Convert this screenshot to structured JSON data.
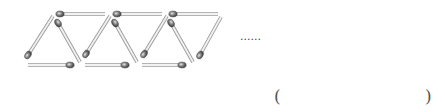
{
  "figure": {
    "triangles_shown": 6,
    "matches": [
      {
        "x1": 60,
        "y1": 14,
        "x2": 105,
        "y2": 14,
        "head": "start"
      },
      {
        "x1": 117,
        "y1": 14,
        "x2": 162,
        "y2": 14,
        "head": "start"
      },
      {
        "x1": 173,
        "y1": 14,
        "x2": 218,
        "y2": 14,
        "head": "start"
      },
      {
        "x1": 28,
        "y1": 65,
        "x2": 70,
        "y2": 65,
        "head": "end"
      },
      {
        "x1": 85,
        "y1": 65,
        "x2": 125,
        "y2": 65,
        "head": "end"
      },
      {
        "x1": 142,
        "y1": 65,
        "x2": 182,
        "y2": 65,
        "head": "end"
      },
      {
        "x1": 28,
        "y1": 55,
        "x2": 53,
        "y2": 16,
        "head": "start"
      },
      {
        "x1": 58,
        "y1": 23,
        "x2": 80,
        "y2": 62,
        "head": "start"
      },
      {
        "x1": 86,
        "y1": 54,
        "x2": 110,
        "y2": 16,
        "head": "start"
      },
      {
        "x1": 115,
        "y1": 23,
        "x2": 137,
        "y2": 62,
        "head": "start"
      },
      {
        "x1": 144,
        "y1": 54,
        "x2": 167,
        "y2": 16,
        "head": "start"
      },
      {
        "x1": 171,
        "y1": 23,
        "x2": 193,
        "y2": 62,
        "head": "start"
      },
      {
        "x1": 200,
        "y1": 55,
        "x2": 221,
        "y2": 17,
        "head": "start"
      }
    ]
  },
  "continuation": "......",
  "answer": {
    "open": "(",
    "close": ")",
    "value": ""
  }
}
